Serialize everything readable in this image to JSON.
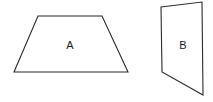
{
  "figure": {
    "background_color": "#ffffff",
    "stroke_color": "#2b2b2b",
    "label_color": "#1a1a1a",
    "width": 213,
    "height": 102,
    "shapes": [
      {
        "id": "shape-a",
        "label": "A",
        "kind": "trapezoid",
        "points": "38,16 102,16 128,72 14,72",
        "label_x": 70,
        "label_y": 45
      },
      {
        "id": "shape-b",
        "label": "B",
        "kind": "quadrilateral",
        "points": "161,7 202,2 203,95 162,72",
        "label_x": 183,
        "label_y": 45
      }
    ]
  }
}
